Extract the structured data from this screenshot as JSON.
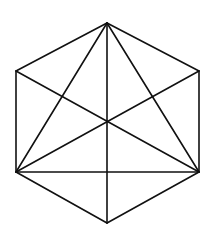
{
  "diagram": {
    "type": "geometric-figure",
    "shape": "hexagon-with-diagonals",
    "stroke_color": "#111111",
    "background": "#ffffff",
    "vertices": {
      "top": [
        107,
        23
      ],
      "upper_right": [
        199,
        71
      ],
      "lower_right": [
        199,
        172
      ],
      "bottom": [
        107,
        223
      ],
      "lower_left": [
        16,
        172
      ],
      "upper_left": [
        16,
        71
      ],
      "center": [
        107,
        122
      ]
    },
    "edges": [
      [
        "top",
        "upper_right"
      ],
      [
        "upper_right",
        "lower_right"
      ],
      [
        "lower_right",
        "bottom"
      ],
      [
        "bottom",
        "lower_left"
      ],
      [
        "lower_left",
        "upper_left"
      ],
      [
        "upper_left",
        "top"
      ],
      [
        "top",
        "bottom"
      ],
      [
        "top",
        "lower_left"
      ],
      [
        "top",
        "lower_right"
      ],
      [
        "upper_left",
        "lower_right"
      ],
      [
        "upper_right",
        "lower_left"
      ],
      [
        "lower_left",
        "lower_right"
      ]
    ]
  }
}
